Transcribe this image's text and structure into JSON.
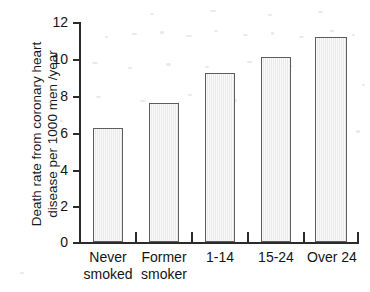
{
  "chart_data": {
    "type": "bar",
    "title": "",
    "subtitle": "",
    "xlabel": "",
    "ylabel": "Death rate from coronary heart disease per 1000 men /year",
    "ylabel_lines": [
      "Death rate from coronary heart",
      "disease per 1000 men /year"
    ],
    "categories": [
      "Never smoked",
      "Former smoker",
      "1-14",
      "15-24",
      "Over 24"
    ],
    "category_lines": [
      [
        "Never",
        "smoked"
      ],
      [
        "Former",
        "smoker"
      ],
      [
        "1-14"
      ],
      [
        "15-24"
      ],
      [
        "Over 24"
      ]
    ],
    "values": [
      6.2,
      7.6,
      9.2,
      10.1,
      11.2
    ],
    "ylim": [
      0,
      12
    ],
    "ytick_labels": [
      "0",
      "2",
      "4",
      "6",
      "8",
      "10",
      "12"
    ],
    "ytick_values": [
      0,
      2,
      4,
      6,
      8,
      10,
      12
    ],
    "grid": false,
    "legend": null,
    "bar_fill_color": "#eaeaea",
    "bar_edge_color": "#5d5d5d",
    "axis_color": "#2b2b2b"
  }
}
